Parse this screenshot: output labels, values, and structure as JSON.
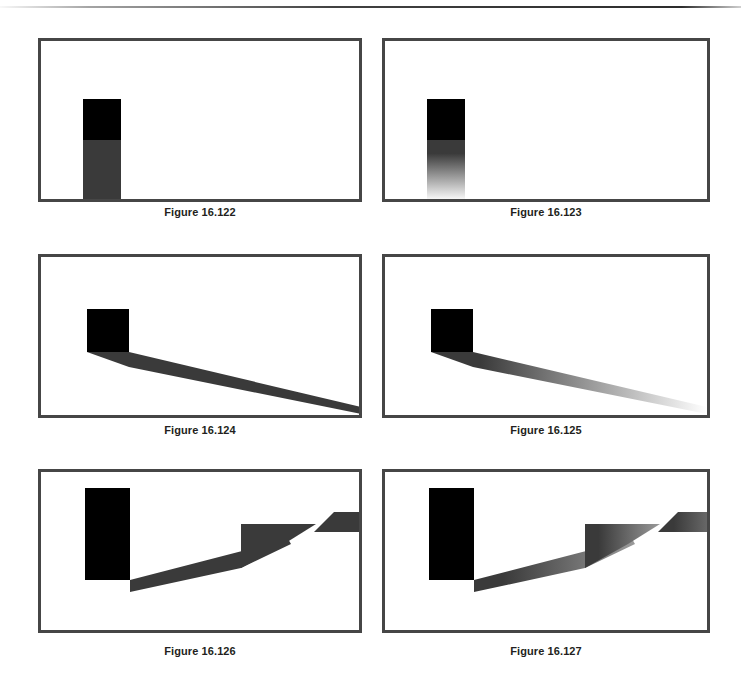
{
  "page": {
    "background_color": "#ffffff",
    "top_rule": true,
    "width": 741,
    "height": 673
  },
  "style": {
    "panel_border_color": "#464646",
    "panel_border_width": 3,
    "panel_background": "#ffffff",
    "caster_color": "#000000",
    "shadow_dark": "#3a3a3a",
    "shadow_mid": "#5c5c5c",
    "shadow_light": "#9a9a9a",
    "caption_color": "#231f20"
  },
  "figures": [
    {
      "id": "figure-16-122",
      "caption": "Figure 16.122",
      "shadow_type": "hard",
      "description": "Vertical box with a hard-edged uniform shadow cast straight down",
      "panel": {
        "x": 38,
        "y": 38,
        "width": 324,
        "height": 164
      },
      "caption_y": 206,
      "caster": {
        "x": 42,
        "y": 58,
        "width": 38,
        "height": 41
      },
      "shadow": {
        "shape": "rect",
        "x": 42,
        "y": 99,
        "width": 38,
        "height": 59,
        "from_color": "#3a3a3a",
        "to_color": "#3a3a3a"
      }
    },
    {
      "id": "figure-16-123",
      "caption": "Figure 16.123",
      "shadow_type": "soft",
      "description": "Vertical box with a soft shadow fading to white downward",
      "panel": {
        "x": 382,
        "y": 38,
        "width": 328,
        "height": 164
      },
      "caption_y": 206,
      "caster": {
        "x": 42,
        "y": 58,
        "width": 38,
        "height": 41
      },
      "shadow": {
        "shape": "rect",
        "x": 42,
        "y": 99,
        "width": 38,
        "height": 61,
        "from_color": "#3a3a3a",
        "to_color": "#ffffff"
      }
    },
    {
      "id": "figure-16-124",
      "caption": "Figure 16.124",
      "shadow_type": "hard",
      "description": "Box with a long hard-edged shadow stretching to the lower right",
      "panel": {
        "x": 38,
        "y": 254,
        "width": 324,
        "height": 164
      },
      "caption_y": 424,
      "caster": {
        "x": 46,
        "y": 52,
        "width": 42,
        "height": 43
      },
      "shadow": {
        "shape": "taper",
        "points": "46,95 88,95 320,150 320,157 88,110",
        "from_color": "#3a3a3a",
        "to_color": "#3a3a3a"
      }
    },
    {
      "id": "figure-16-125",
      "caption": "Figure 16.125",
      "shadow_type": "soft",
      "description": "Box with a long shadow stretching to the lower right and fading out",
      "panel": {
        "x": 382,
        "y": 254,
        "width": 328,
        "height": 164
      },
      "caption_y": 424,
      "caster": {
        "x": 46,
        "y": 52,
        "width": 42,
        "height": 43
      },
      "shadow": {
        "shape": "taper",
        "points": "46,95 88,95 322,150 322,157 88,110",
        "from_color": "#3a3a3a",
        "to_color": "#ffffff"
      }
    },
    {
      "id": "figure-16-126",
      "caption": "Figure 16.126",
      "shadow_type": "hard",
      "description": "Tall box with a hard shadow bending up a step, plus a detached parallelogram patch",
      "panel": {
        "x": 38,
        "y": 469,
        "width": 324,
        "height": 164
      },
      "caption_y": 645,
      "caster": {
        "x": 44,
        "y": 16,
        "width": 45,
        "height": 92
      },
      "shadow": {
        "shape": "bent",
        "body_points": "44,92 89,92 89,108 50,108",
        "ramp_points": "89,108 205,78 243,60 250,72 200,96 89,120",
        "riser_points": "200,52 275,52 243,72 200,96",
        "patch_points": "293,40 360,40 340,60 273,60",
        "from_color": "#3a3a3a",
        "to_color": "#3a3a3a"
      }
    },
    {
      "id": "figure-16-127",
      "caption": "Figure 16.127",
      "shadow_type": "soft",
      "description": "Tall box with a shadow bending up a step that lightens with distance, plus a lighter detached patch",
      "panel": {
        "x": 382,
        "y": 469,
        "width": 328,
        "height": 164
      },
      "caption_y": 645,
      "caster": {
        "x": 44,
        "y": 16,
        "width": 45,
        "height": 92
      },
      "shadow": {
        "shape": "bent",
        "body_points": "44,92 89,92 89,108 50,108",
        "ramp_points": "89,108 205,78 243,60 250,72 200,96 89,120",
        "riser_points": "200,52 275,52 243,72 200,96",
        "patch_points": "293,40 360,40 340,60 273,60",
        "from_color": "#3a3a3a",
        "to_color": "#9a9a9a"
      }
    }
  ]
}
